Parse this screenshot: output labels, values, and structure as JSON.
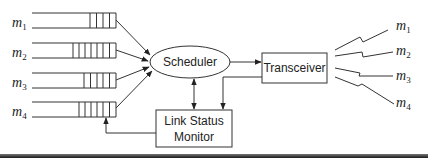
{
  "diagram": {
    "type": "wireless scheduler architecture",
    "queues": [
      {
        "label": "m",
        "sub": "1",
        "cells": 4
      },
      {
        "label": "m",
        "sub": "2",
        "cells": 7
      },
      {
        "label": "m",
        "sub": "3",
        "cells": 5
      },
      {
        "label": "m",
        "sub": "4",
        "cells": 6
      }
    ],
    "scheduler": {
      "label": "Scheduler"
    },
    "transceiver": {
      "label": "Transceiver"
    },
    "link_status_monitor": {
      "line1": "Link Status",
      "line2": "Monitor"
    },
    "mobiles": [
      {
        "label": "m",
        "sub": "1"
      },
      {
        "label": "m",
        "sub": "2"
      },
      {
        "label": "m",
        "sub": "3"
      },
      {
        "label": "m",
        "sub": "4"
      }
    ],
    "colors": {
      "line": "#333333",
      "text": "#222222",
      "background": "#ffffff"
    }
  }
}
